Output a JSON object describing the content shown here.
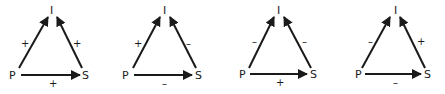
{
  "diagrams": [
    {
      "nodes": {
        "top": "I",
        "left": "P",
        "right": "S"
      },
      "edges": {
        "p_to_i": "+",
        "s_to_i": "+",
        "p_to_s": "+"
      }
    },
    {
      "nodes": {
        "top": "I",
        "left": "P",
        "right": "S"
      },
      "edges": {
        "p_to_i": "+",
        "s_to_i": "–",
        "p_to_s": "–"
      }
    },
    {
      "nodes": {
        "top": "I",
        "left": "P",
        "right": "S"
      },
      "edges": {
        "p_to_i": "–",
        "s_to_i": "–",
        "p_to_s": "+"
      }
    },
    {
      "nodes": {
        "top": "I",
        "left": "P",
        "right": "S"
      },
      "edges": {
        "p_to_i": "–",
        "s_to_i": "+",
        "p_to_s": "–"
      }
    }
  ]
}
